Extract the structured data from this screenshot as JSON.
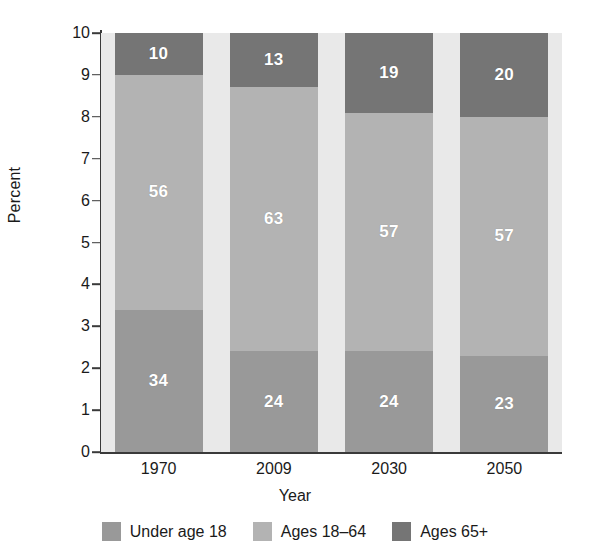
{
  "chart_data": {
    "type": "bar",
    "subtype": "stacked-bar-100pct",
    "title": "",
    "xlabel": "Year",
    "ylabel": "Percent",
    "categories": [
      "1970",
      "2009",
      "2030",
      "2050"
    ],
    "ylim": [
      0,
      10
    ],
    "yticks": [
      "0",
      "1",
      "2",
      "3",
      "4",
      "5",
      "6",
      "7",
      "8",
      "9",
      "10"
    ],
    "ytick_values": [
      0,
      1,
      2,
      3,
      4,
      5,
      6,
      7,
      8,
      9,
      10
    ],
    "grid": false,
    "legend_position": "bottom",
    "series": [
      {
        "name": "Under age 18",
        "color": "#999999",
        "values": [
          34,
          24,
          24,
          23
        ],
        "labels": [
          "34",
          "24",
          "24",
          "23"
        ]
      },
      {
        "name": "Ages 18–64",
        "color": "#b3b3b3",
        "values": [
          56,
          63,
          57,
          57
        ],
        "labels": [
          "56",
          "63",
          "57",
          "57"
        ]
      },
      {
        "name": "Ages 65+",
        "color": "#757575",
        "values": [
          10,
          13,
          19,
          20
        ],
        "labels": [
          "10",
          "13",
          "19",
          "20"
        ]
      }
    ]
  },
  "axes": {
    "y_title": "Percent",
    "x_title": "Year",
    "ytick_0": "0",
    "ytick_1": "1",
    "ytick_2": "2",
    "ytick_3": "3",
    "ytick_4": "4",
    "ytick_5": "5",
    "ytick_6": "6",
    "ytick_7": "7",
    "ytick_8": "8",
    "ytick_9": "9",
    "ytick_10": "10",
    "xtick_0": "1970",
    "xtick_1": "2009",
    "xtick_2": "2030",
    "xtick_3": "2050"
  },
  "legend": {
    "items": [
      {
        "label": "Under age 18",
        "color": "#999999"
      },
      {
        "label": "Ages 18–64",
        "color": "#b3b3b3"
      },
      {
        "label": "Ages 65+",
        "color": "#757575"
      }
    ]
  },
  "colors": {
    "plot_background": "#e9e9e9",
    "page_background": "#ffffff",
    "axis": "#3a3a3a",
    "text": "#1a1a1a",
    "value_label": "#ffffff"
  }
}
